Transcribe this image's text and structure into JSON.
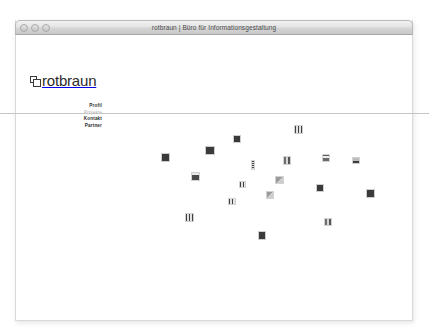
{
  "window": {
    "title": "rotbraun | Büro für Informationsgestaltung",
    "controls": [
      {
        "name": "close",
        "label": ""
      },
      {
        "name": "minimize",
        "label": ""
      },
      {
        "name": "zoom",
        "label": ""
      }
    ]
  },
  "site": {
    "logo_text": "rotbraun",
    "logo_mark": "two-overlapping-squares-icon"
  },
  "nav": {
    "items": [
      {
        "label": "Profil",
        "state": "normal"
      },
      {
        "label": "Projekte",
        "state": "dim"
      },
      {
        "label": "Kontakt",
        "state": "normal"
      },
      {
        "label": "Partner",
        "state": "normal"
      }
    ]
  },
  "colors": {
    "page_background": "#ffffff",
    "rule": "#c5c5c5",
    "text": "#2d2d2d",
    "text_dim": "#b0b0b0",
    "titlebar_text": "#4a4a4a"
  },
  "scatter": {
    "description": "project thumbnails scattered across the page",
    "thumbnails": [
      {
        "id": "t01",
        "x": 278,
        "y": 75,
        "w": 9,
        "h": 9,
        "tex": "tex-e"
      },
      {
        "id": "t02",
        "x": 217,
        "y": 85,
        "w": 8,
        "h": 8,
        "tex": "tex-a"
      },
      {
        "id": "t03",
        "x": 189,
        "y": 96,
        "w": 10,
        "h": 9,
        "tex": "tex-a"
      },
      {
        "id": "t04",
        "x": 145,
        "y": 103,
        "w": 9,
        "h": 9,
        "tex": "tex-a"
      },
      {
        "id": "t05",
        "x": 306,
        "y": 104,
        "w": 8,
        "h": 8,
        "tex": "tex-h"
      },
      {
        "id": "t06",
        "x": 267,
        "y": 106,
        "w": 8,
        "h": 9,
        "tex": "tex-c"
      },
      {
        "id": "t07",
        "x": 336,
        "y": 107,
        "w": 8,
        "h": 7,
        "tex": "tex-g"
      },
      {
        "id": "t08",
        "x": 235,
        "y": 110,
        "w": 4,
        "h": 10,
        "tex": "tex-d"
      },
      {
        "id": "t09",
        "x": 175,
        "y": 122,
        "w": 9,
        "h": 9,
        "tex": "tex-b"
      },
      {
        "id": "t10",
        "x": 259,
        "y": 126,
        "w": 9,
        "h": 8,
        "tex": "tex-f"
      },
      {
        "id": "t11",
        "x": 300,
        "y": 134,
        "w": 8,
        "h": 8,
        "tex": "tex-a"
      },
      {
        "id": "t12",
        "x": 350,
        "y": 139,
        "w": 9,
        "h": 9,
        "tex": "tex-a"
      },
      {
        "id": "t13",
        "x": 223,
        "y": 131,
        "w": 7,
        "h": 7,
        "tex": "tex-e"
      },
      {
        "id": "t14",
        "x": 250,
        "y": 141,
        "w": 8,
        "h": 8,
        "tex": "tex-f"
      },
      {
        "id": "t15",
        "x": 212,
        "y": 148,
        "w": 8,
        "h": 7,
        "tex": "tex-e"
      },
      {
        "id": "t16",
        "x": 169,
        "y": 163,
        "w": 9,
        "h": 9,
        "tex": "tex-e"
      },
      {
        "id": "t17",
        "x": 308,
        "y": 168,
        "w": 8,
        "h": 8,
        "tex": "tex-c"
      },
      {
        "id": "t18",
        "x": 242,
        "y": 181,
        "w": 8,
        "h": 9,
        "tex": "tex-a"
      }
    ]
  }
}
